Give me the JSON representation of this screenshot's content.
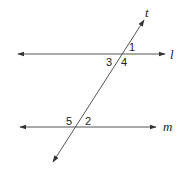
{
  "diagram": {
    "type": "parallel lines cut by transversal",
    "lines": {
      "l": {
        "label": "l"
      },
      "m": {
        "label": "m"
      },
      "t": {
        "label": "t"
      }
    },
    "angles": [
      {
        "label": "1"
      },
      {
        "label": "3"
      },
      {
        "label": "4"
      },
      {
        "label": "5"
      },
      {
        "label": "2"
      }
    ],
    "colors": {
      "stroke": "#333333",
      "text": "#222222",
      "background": "#ffffff"
    }
  }
}
